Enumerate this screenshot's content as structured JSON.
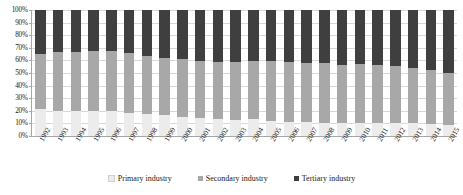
{
  "chart_data": {
    "type": "bar",
    "stacked": true,
    "normalized_percent": true,
    "title": "",
    "xlabel": "",
    "ylabel": "",
    "ylim": [
      0,
      100
    ],
    "y_ticks": [
      "0%",
      "10%",
      "20%",
      "30%",
      "40%",
      "50%",
      "60%",
      "70%",
      "80%",
      "90%",
      "100%"
    ],
    "grid": true,
    "legend_position": "bottom",
    "categories": [
      "1992",
      "1993",
      "1994",
      "1995",
      "1996",
      "1997",
      "1998",
      "1999",
      "2000",
      "2001",
      "2002",
      "2003",
      "2004",
      "2005",
      "2006",
      "2007",
      "2008",
      "2009",
      "2010",
      "2011",
      "2012",
      "2013",
      "2014",
      "2015"
    ],
    "series": [
      {
        "name": "Primary industry",
        "color": "#ececec",
        "values": [
          21.8,
          19.7,
          19.9,
          20.0,
          19.7,
          18.3,
          17.6,
          16.5,
          15.1,
          14.4,
          13.7,
          12.8,
          13.4,
          12.1,
          11.1,
          10.8,
          10.7,
          10.3,
          10.1,
          10.0,
          10.1,
          10.0,
          9.5,
          9.0
        ]
      },
      {
        "name": "Secondary industry",
        "color": "#a8a8a8",
        "values": [
          43.4,
          46.6,
          46.6,
          47.2,
          47.5,
          47.5,
          46.2,
          45.8,
          45.9,
          45.2,
          44.8,
          46.0,
          46.2,
          47.4,
          47.9,
          47.3,
          47.4,
          46.2,
          46.7,
          46.6,
          45.3,
          43.9,
          43.1,
          40.9
        ]
      },
      {
        "name": "Tertiary industry",
        "color": "#3f3f3f",
        "values": [
          34.8,
          33.7,
          33.5,
          32.8,
          32.8,
          34.2,
          36.2,
          37.7,
          39.0,
          40.4,
          41.5,
          41.2,
          40.4,
          40.5,
          41.0,
          41.9,
          41.9,
          43.5,
          43.2,
          43.4,
          44.6,
          46.1,
          47.4,
          50.1
        ]
      }
    ]
  }
}
